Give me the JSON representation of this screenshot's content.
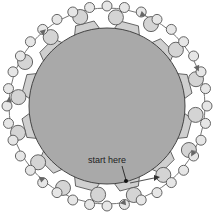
{
  "diagram": {
    "label": "start here",
    "colors": {
      "core_fill": "#a9a9a9",
      "core_stroke": "#444444",
      "segment_fill": "#cfcfcf",
      "bead_fill": "#d4d4d4",
      "bead_stroke": "#555555",
      "path_stroke": "#777777",
      "start_dot": "#111111"
    }
  }
}
